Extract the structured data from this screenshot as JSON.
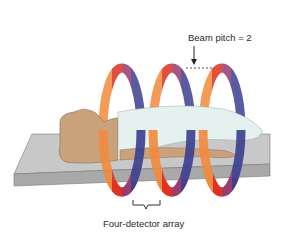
{
  "diagram": {
    "labels": {
      "beam_pitch": "Beam pitch = 2",
      "detector_array": "Four-detector array"
    },
    "components": [
      "patient",
      "table",
      "helical x-ray beam path (3 turns)",
      "four-detector array bracket",
      "beam pitch gap indicator"
    ],
    "helix_turns": 3,
    "band_colors": [
      "#f28a3c",
      "#e0301e",
      "#9a3a6e",
      "#3b3f8f"
    ],
    "colors": {
      "table_top": "#c8c8c8",
      "table_side": "#a9a9a9",
      "skin": "#c9a27c",
      "gown": "#e4f1ef",
      "text": "#2a2a2a"
    }
  }
}
